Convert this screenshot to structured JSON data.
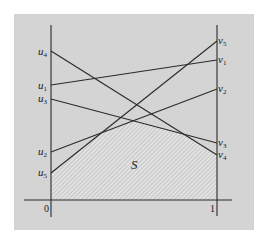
{
  "figure": {
    "background": "#ffffff",
    "panel_color": "#d4d4d4",
    "line_color": "#2a2a2a",
    "region_label": "S",
    "x_ticks": [
      "0",
      "1"
    ],
    "left_labels": [
      {
        "name": "u",
        "sub": "4"
      },
      {
        "name": "u",
        "sub": "1"
      },
      {
        "name": "u",
        "sub": "3"
      },
      {
        "name": "u",
        "sub": "2"
      },
      {
        "name": "u",
        "sub": "5"
      }
    ],
    "right_labels": [
      {
        "name": "v",
        "sub": "5"
      },
      {
        "name": "v",
        "sub": "1"
      },
      {
        "name": "v",
        "sub": "2"
      },
      {
        "name": "v",
        "sub": "3"
      },
      {
        "name": "v",
        "sub": "4"
      }
    ],
    "segments": [
      {
        "from": "u1",
        "to": "v1"
      },
      {
        "from": "u2",
        "to": "v2"
      },
      {
        "from": "u3",
        "to": "v3"
      },
      {
        "from": "u4",
        "to": "v4"
      },
      {
        "from": "u5",
        "to": "v5"
      }
    ]
  }
}
